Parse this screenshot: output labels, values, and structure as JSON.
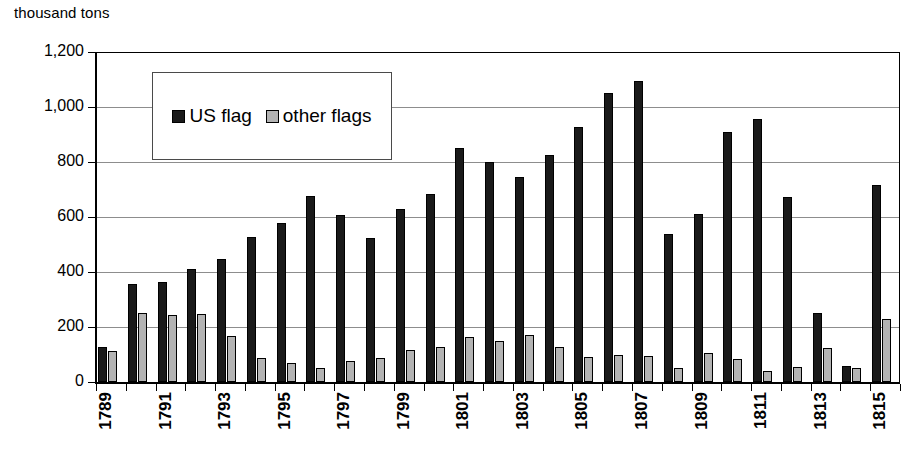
{
  "chart_data": {
    "type": "bar",
    "title": "",
    "ylabel": "thousand tons",
    "xlabel": "",
    "ylim": [
      0,
      1200
    ],
    "yticks": [
      0,
      200,
      400,
      600,
      800,
      1000,
      1200
    ],
    "ytick_labels": [
      "0",
      "200",
      "400",
      "600",
      "800",
      "1,000",
      "1,200"
    ],
    "grid": true,
    "legend_position": "upper-left-inside",
    "categories": [
      "1789",
      "1790",
      "1791",
      "1792",
      "1793",
      "1794",
      "1795",
      "1796",
      "1797",
      "1798",
      "1799",
      "1800",
      "1801",
      "1802",
      "1803",
      "1804",
      "1805",
      "1806",
      "1807",
      "1808",
      "1809",
      "1810",
      "1811",
      "1812",
      "1813",
      "1814",
      "1815"
    ],
    "tick_label_every": 2,
    "visible_tick_labels": [
      "1789",
      "1791",
      "1793",
      "1795",
      "1797",
      "1799",
      "1801",
      "1803",
      "1805",
      "1807",
      "1809",
      "1811",
      "1813",
      "1815"
    ],
    "series": [
      {
        "name": "US flag",
        "color": "#1a1a1a",
        "values": [
          127,
          355,
          363,
          411,
          448,
          529,
          580,
          675,
          608,
          523,
          630,
          682,
          851,
          800,
          745,
          825,
          927,
          1050,
          1095,
          537,
          611,
          910,
          955,
          674,
          250,
          60,
          717
        ]
      },
      {
        "name": "other flags",
        "color": "#b3b3b3",
        "values": [
          111,
          251,
          243,
          248,
          168,
          88,
          68,
          52,
          78,
          88,
          116,
          126,
          164,
          148,
          170,
          128,
          92,
          97,
          94,
          52,
          107,
          85,
          39,
          56,
          125,
          52,
          228
        ]
      }
    ]
  },
  "legend": {
    "items": [
      {
        "label": "US flag",
        "swatch": "dark-square-icon"
      },
      {
        "label": "other flags",
        "swatch": "gray-square-icon"
      }
    ]
  }
}
